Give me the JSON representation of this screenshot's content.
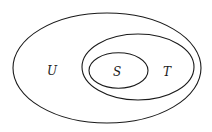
{
  "diagram": {
    "type": "venn-nested-sets",
    "sets": [
      {
        "label": "U",
        "contains": [
          "T"
        ]
      },
      {
        "label": "T",
        "contains": [
          "S"
        ]
      },
      {
        "label": "S",
        "contains": []
      }
    ],
    "labels": {
      "outer": "U",
      "middle": "T",
      "inner": "S"
    },
    "stroke_color": "#1a1a1a",
    "background": "#ffffff"
  }
}
